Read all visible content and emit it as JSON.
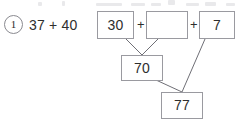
{
  "worksheet": {
    "problem_number": "1",
    "expression": "37 + 40",
    "operator": "+",
    "top_row": [
      {
        "name": "addend-tens",
        "value": "30",
        "empty": false
      },
      {
        "name": "addend-blank",
        "value": "",
        "empty": true
      },
      {
        "name": "addend-ones",
        "value": "7",
        "empty": false
      }
    ],
    "partial_sum": {
      "name": "partial-sum",
      "value": "70"
    },
    "total_sum": {
      "name": "total-sum",
      "value": "77"
    },
    "colors": {
      "ink": "#2e2e2e",
      "box_border": "#9a9aa0",
      "circle_border": "#8a8a90",
      "connector": "#6f6f76",
      "page_background": "#ffffff"
    }
  }
}
